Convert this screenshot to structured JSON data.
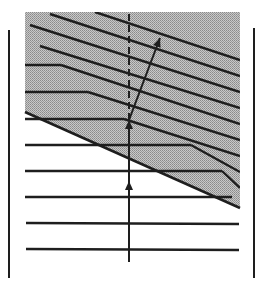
{
  "diagram": {
    "type": "wave-refraction-at-interface",
    "colors": {
      "background": "#ffffff",
      "ink": "#1e1e1e",
      "shade": "#b4b4b4"
    },
    "borders": {
      "left": {
        "x": 9,
        "y1": 30,
        "y2": 278
      },
      "right": {
        "x": 254,
        "y1": 28,
        "y2": 278
      }
    },
    "shaded_region": {
      "points": [
        [
          25,
          12
        ],
        [
          240,
          12
        ],
        [
          240,
          208
        ],
        [
          25,
          112
        ]
      ]
    },
    "interface_line": {
      "x1": 25,
      "y1": 112,
      "x2": 240,
      "y2": 208
    },
    "incident_wavefronts": [
      {
        "x1": 25,
        "y1": 65,
        "x2": 61,
        "y2": 65
      },
      {
        "x1": 25,
        "y1": 92,
        "x2": 88,
        "y2": 92
      },
      {
        "x1": 25,
        "y1": 119,
        "x2": 124,
        "y2": 119
      },
      {
        "x1": 25,
        "y1": 145,
        "x2": 191,
        "y2": 145
      },
      {
        "x1": 25,
        "y1": 171,
        "x2": 222,
        "y2": 171
      },
      {
        "x1": 25,
        "y1": 197,
        "x2": 232,
        "y2": 197
      },
      {
        "x1": 26,
        "y1": 223,
        "x2": 239,
        "y2": 224
      },
      {
        "x1": 26,
        "y1": 249,
        "x2": 239,
        "y2": 250
      }
    ],
    "refracted_wavefronts": [
      {
        "x1": 95,
        "y1": 12,
        "x2": 240,
        "y2": 60
      },
      {
        "x1": 50,
        "y1": 14,
        "x2": 240,
        "y2": 76
      },
      {
        "x1": 30,
        "y1": 25,
        "x2": 240,
        "y2": 92
      },
      {
        "x1": 40,
        "y1": 46,
        "x2": 240,
        "y2": 108
      },
      {
        "x1": 61,
        "y1": 65,
        "x2": 240,
        "y2": 124
      },
      {
        "x1": 88,
        "y1": 92,
        "x2": 240,
        "y2": 140
      },
      {
        "x1": 124,
        "y1": 119,
        "x2": 240,
        "y2": 156
      },
      {
        "x1": 191,
        "y1": 145,
        "x2": 240,
        "y2": 172
      },
      {
        "x1": 222,
        "y1": 171,
        "x2": 240,
        "y2": 188
      }
    ],
    "incident_ray": {
      "x": 129,
      "y_bottom": 262,
      "y_top": 120,
      "arrowheads_y": [
        181,
        120
      ]
    },
    "continuation_ray_dashed": {
      "x": 129,
      "y1": 120,
      "y2": 12
    },
    "refracted_ray": {
      "x1": 129,
      "y1": 120,
      "x2": 160,
      "y2": 38
    }
  }
}
